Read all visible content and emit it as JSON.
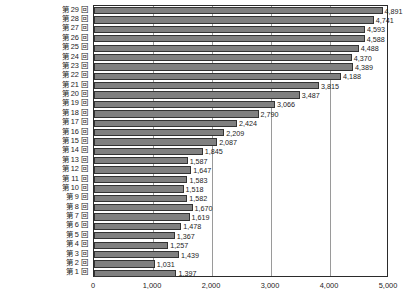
{
  "chart_data": {
    "type": "bar",
    "orientation": "horizontal",
    "title": "",
    "subtitle": "",
    "xlabel": "",
    "ylabel": "",
    "xlim": [
      0,
      5000
    ],
    "x_ticks": [
      0,
      1000,
      2000,
      3000,
      4000,
      5000
    ],
    "x_tick_labels": [
      "0",
      "1,000",
      "2,000",
      "3,000",
      "4,000",
      "5,000"
    ],
    "grid": true,
    "grid_axis": "x",
    "legend": false,
    "legend_position": "none",
    "bar_color": "#808080",
    "bar_border_color": "#333333",
    "frame_color": "#2b2b2b",
    "gridline_color": "#9a9a9a",
    "categories": [
      "第 29 回",
      "第 28 回",
      "第 27 回",
      "第 26 回",
      "第 25 回",
      "第 24 回",
      "第 23 回",
      "第 22 回",
      "第 21 回",
      "第 20 回",
      "第 19 回",
      "第 18 回",
      "第 17 回",
      "第 16 回",
      "第 15 回",
      "第 14 回",
      "第 13 回",
      "第 12 回",
      "第 11 回",
      "第 10 回",
      "第 9 回",
      "第 8 回",
      "第 7 回",
      "第 6 回",
      "第 5 回",
      "第 4 回",
      "第 3 回",
      "第 2 回",
      "第 1 回"
    ],
    "values": [
      4891,
      4741,
      4593,
      4588,
      4488,
      4370,
      4389,
      4188,
      3815,
      3487,
      3066,
      2790,
      2424,
      2209,
      2087,
      1845,
      1587,
      1647,
      1583,
      1518,
      1582,
      1670,
      1619,
      1478,
      1367,
      1257,
      1439,
      1031,
      1397
    ],
    "value_labels": [
      "4,891",
      "4,741",
      "4,593",
      "4,588",
      "4,488",
      "4,370",
      "4,389",
      "4,188",
      "3,815",
      "3,487",
      "3,066",
      "2,790",
      "2,424",
      "2,209",
      "2,087",
      "1,845",
      "1,587",
      "1,647",
      "1,583",
      "1,518",
      "1,582",
      "1,670",
      "1,619",
      "1,478",
      "1,367",
      "1,257",
      "1,439",
      "1,031",
      "1,397"
    ]
  }
}
